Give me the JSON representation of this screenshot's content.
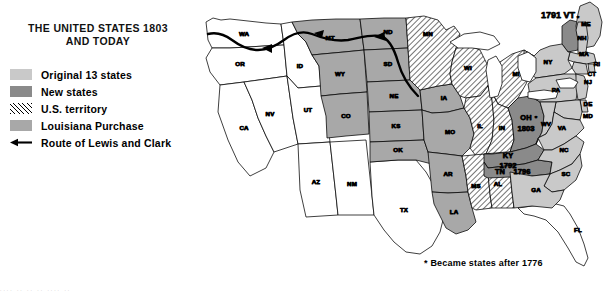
{
  "title": {
    "line1": "THE UNITED STATES 1803",
    "line2": "AND TODAY"
  },
  "legend": {
    "items": [
      {
        "key": "original",
        "label": "Original 13 states",
        "swatch": "light-gray-solid",
        "color": "#c9c9c9"
      },
      {
        "key": "new",
        "label": "New states",
        "swatch": "dark-gray-solid",
        "color": "#8a8a8a"
      },
      {
        "key": "territory",
        "label": "U.S. territory",
        "swatch": "diagonal-hatch",
        "color": "#000000"
      },
      {
        "key": "louisiana",
        "label": "Louisiana Purchase",
        "swatch": "medium-gray-solid",
        "color": "#a8a8a8"
      },
      {
        "key": "route",
        "label": "Route of Lewis and Clark",
        "swatch": "left-arrow-line",
        "color": "#000000"
      }
    ]
  },
  "footnote": "* Became states after 1776",
  "map": {
    "vermont_annotation": "1791 VT",
    "year_labels": [
      {
        "state": "OH",
        "year": "1803"
      },
      {
        "state": "KY",
        "year": "1792"
      },
      {
        "state": "TN",
        "year": "1796"
      }
    ],
    "asterisk_states": [
      "ME",
      "WV"
    ],
    "states": [
      {
        "abbr": "WA",
        "category": "none"
      },
      {
        "abbr": "OR",
        "category": "none"
      },
      {
        "abbr": "CA",
        "category": "none"
      },
      {
        "abbr": "NV",
        "category": "none"
      },
      {
        "abbr": "ID",
        "category": "none"
      },
      {
        "abbr": "UT",
        "category": "none"
      },
      {
        "abbr": "AZ",
        "category": "none"
      },
      {
        "abbr": "NM",
        "category": "none"
      },
      {
        "abbr": "TX",
        "category": "none"
      },
      {
        "abbr": "FL",
        "category": "none"
      },
      {
        "abbr": "MT",
        "category": "louisiana"
      },
      {
        "abbr": "WY",
        "category": "louisiana"
      },
      {
        "abbr": "CO",
        "category": "louisiana"
      },
      {
        "abbr": "ND",
        "category": "louisiana"
      },
      {
        "abbr": "SD",
        "category": "louisiana"
      },
      {
        "abbr": "NE",
        "category": "louisiana"
      },
      {
        "abbr": "KS",
        "category": "louisiana"
      },
      {
        "abbr": "OK",
        "category": "louisiana"
      },
      {
        "abbr": "IA",
        "category": "louisiana"
      },
      {
        "abbr": "MO",
        "category": "louisiana"
      },
      {
        "abbr": "AR",
        "category": "louisiana"
      },
      {
        "abbr": "LA",
        "category": "louisiana"
      },
      {
        "abbr": "MN",
        "category": "territory"
      },
      {
        "abbr": "WI",
        "category": "territory"
      },
      {
        "abbr": "MI",
        "category": "territory"
      },
      {
        "abbr": "IL",
        "category": "territory"
      },
      {
        "abbr": "IN",
        "category": "territory"
      },
      {
        "abbr": "MS",
        "category": "territory"
      },
      {
        "abbr": "AL",
        "category": "territory"
      },
      {
        "abbr": "OH",
        "category": "new"
      },
      {
        "abbr": "KY",
        "category": "new"
      },
      {
        "abbr": "TN",
        "category": "new"
      },
      {
        "abbr": "VT",
        "category": "new"
      },
      {
        "abbr": "ME",
        "category": "original"
      },
      {
        "abbr": "NH",
        "category": "original"
      },
      {
        "abbr": "MA",
        "category": "original"
      },
      {
        "abbr": "RI",
        "category": "original"
      },
      {
        "abbr": "CT",
        "category": "original"
      },
      {
        "abbr": "NY",
        "category": "original"
      },
      {
        "abbr": "NJ",
        "category": "original"
      },
      {
        "abbr": "PA",
        "category": "original"
      },
      {
        "abbr": "DE",
        "category": "original"
      },
      {
        "abbr": "MD",
        "category": "original"
      },
      {
        "abbr": "VA",
        "category": "original"
      },
      {
        "abbr": "WV",
        "category": "original"
      },
      {
        "abbr": "NC",
        "category": "original"
      },
      {
        "abbr": "SC",
        "category": "original"
      },
      {
        "abbr": "GA",
        "category": "original"
      }
    ]
  },
  "bottom_strip": "....  ..  ..  ..   ....   .."
}
